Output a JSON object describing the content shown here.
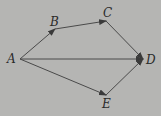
{
  "diagram": {
    "background": "#b5b5b3",
    "stroke_color": "#4a4a4a",
    "points": {
      "A": {
        "label": "A",
        "x": 20,
        "y": 59,
        "lx": 7,
        "ly": 63
      },
      "B": {
        "label": "B",
        "x": 55,
        "y": 29,
        "lx": 50,
        "ly": 26
      },
      "C": {
        "label": "C",
        "x": 106,
        "y": 21,
        "lx": 103,
        "ly": 17
      },
      "D": {
        "label": "D",
        "x": 143,
        "y": 59,
        "lx": 146,
        "ly": 64
      },
      "E": {
        "label": "E",
        "x": 106,
        "y": 95,
        "lx": 102,
        "ly": 108
      }
    },
    "edges": [
      {
        "from": "A",
        "to": "B"
      },
      {
        "from": "B",
        "to": "C"
      },
      {
        "from": "C",
        "to": "D"
      },
      {
        "from": "A",
        "to": "D"
      },
      {
        "from": "A",
        "to": "E"
      },
      {
        "from": "E",
        "to": "D"
      }
    ]
  }
}
